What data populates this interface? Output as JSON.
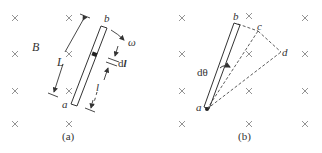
{
  "figure": {
    "panel_a": {
      "caption": "(a)",
      "field_label": "B",
      "rod_end_top": "b",
      "rod_end_bottom": "a",
      "length_label": "L",
      "angular_velocity_label": "ω",
      "element_label": "dl",
      "element_label_d": "d",
      "element_label_l": "l",
      "distance_label": "l"
    },
    "panel_b": {
      "caption": "(b)",
      "point_a": "a",
      "point_b": "b",
      "point_c": "c",
      "point_d": "d",
      "angle_label": "dθ"
    },
    "colors": {
      "stroke": "#333333",
      "cross": "#888888",
      "background": "#ffffff"
    }
  }
}
